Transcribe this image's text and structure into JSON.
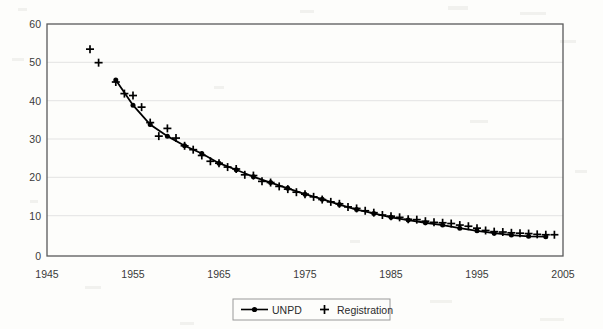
{
  "chart_data": {
    "type": "line",
    "title": "",
    "subtitle": "",
    "xlabel": "",
    "ylabel": "",
    "xlim": [
      1945,
      2005
    ],
    "ylim": [
      0,
      60
    ],
    "x_ticks": [
      1945,
      1955,
      1965,
      1975,
      1985,
      1995,
      2005
    ],
    "y_ticks": [
      0,
      10,
      20,
      30,
      40,
      50,
      60
    ],
    "grid": "horizontal",
    "legend_position": "bottom-center",
    "series": [
      {
        "name": "UNPD",
        "marker": "filled-circle",
        "line": "solid",
        "color": "#000000",
        "x": [
          1953,
          1955,
          1957,
          1959,
          1961,
          1963,
          1965,
          1967,
          1969,
          1971,
          1973,
          1975,
          1977,
          1979,
          1981,
          1983,
          1985,
          1987,
          1989,
          1991,
          1993,
          1995,
          1997,
          1999,
          2001,
          2003
        ],
        "values": [
          45.5,
          39.0,
          34.0,
          31.0,
          28.5,
          26.5,
          24.0,
          22.3,
          20.5,
          19.0,
          17.5,
          16.0,
          14.7,
          13.3,
          12.0,
          11.0,
          10.0,
          9.3,
          8.6,
          8.0,
          7.2,
          6.5,
          5.9,
          5.4,
          5.1,
          5.0
        ]
      },
      {
        "name": "Registration",
        "marker": "plus",
        "line": "none",
        "color": "#000000",
        "x": [
          1950,
          1951,
          1953,
          1954,
          1955,
          1956,
          1957,
          1958,
          1959,
          1960,
          1961,
          1962,
          1963,
          1964,
          1965,
          1966,
          1967,
          1968,
          1969,
          1970,
          1971,
          1972,
          1973,
          1974,
          1975,
          1976,
          1977,
          1978,
          1979,
          1980,
          1981,
          1982,
          1983,
          1984,
          1985,
          1986,
          1987,
          1988,
          1989,
          1990,
          1991,
          1992,
          1993,
          1994,
          1995,
          1996,
          1997,
          1998,
          1999,
          2000,
          2001,
          2002,
          2003,
          2004
        ],
        "values": [
          53.5,
          50.0,
          45.0,
          42.0,
          41.5,
          38.5,
          34.5,
          31.0,
          33.0,
          30.5,
          28.5,
          27.5,
          26.0,
          24.5,
          24.0,
          23.0,
          22.5,
          21.0,
          20.8,
          19.3,
          19.0,
          18.0,
          17.3,
          16.5,
          16.0,
          15.3,
          14.6,
          14.0,
          13.5,
          12.7,
          12.3,
          11.7,
          11.2,
          10.6,
          10.3,
          10.0,
          9.5,
          9.4,
          9.0,
          8.7,
          8.6,
          8.4,
          8.0,
          7.7,
          7.2,
          6.6,
          6.3,
          6.2,
          6.0,
          5.9,
          5.8,
          5.6,
          5.5,
          5.5
        ]
      }
    ]
  },
  "axis": {
    "y_tick_labels": [
      "60",
      "50",
      "40",
      "30",
      "20",
      "10",
      "0"
    ],
    "x_tick_labels": [
      "1945",
      "1955",
      "1965",
      "1975",
      "1985",
      "1995",
      "2005"
    ]
  },
  "legend": {
    "entries": [
      {
        "label": "UNPD",
        "marker": "line-with-dot"
      },
      {
        "label": "Registration",
        "marker": "plus"
      }
    ]
  },
  "colors": {
    "ink": "#000000",
    "axis": "#555555",
    "grid": "#e2e2e2",
    "paper": "#fdfdfb",
    "tick_text": "#3a3a3a"
  }
}
